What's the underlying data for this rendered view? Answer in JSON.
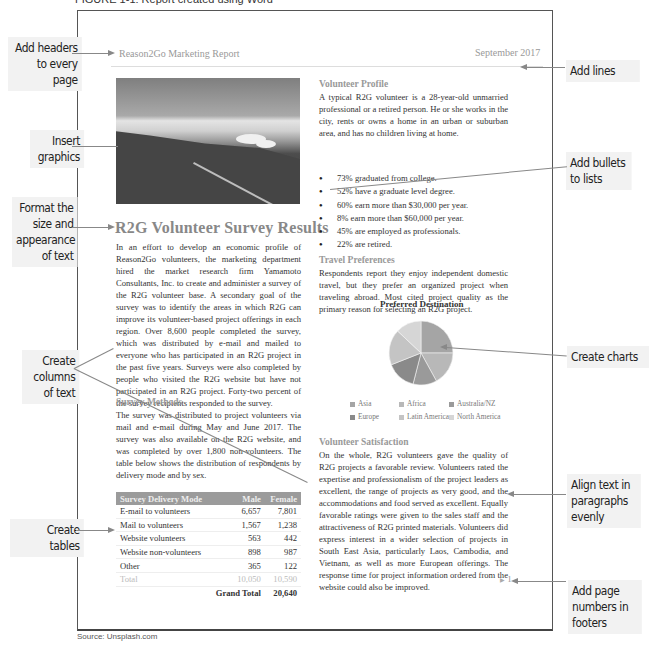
{
  "caption": {
    "top": "FIGURE 1-1: Report created using Word",
    "source": "Source: Unsplash.com"
  },
  "callouts": {
    "headers": "Add headers to every page",
    "graphics": "Insert graphics",
    "format": "Format the size and appearance of text",
    "columns": "Create columns of text",
    "tables": "Create tables",
    "lines": "Add lines",
    "bullets": "Add bullets to lists",
    "charts": "Create charts",
    "align": "Align text in paragraphs evenly",
    "page_numbers": "Add page numbers in footers"
  },
  "document": {
    "header_left": "Reason2Go Marketing Report",
    "header_right": "September 2017",
    "title": "R2G Volunteer Survey Results",
    "intro": "In an effort to develop an economic profile of Reason2Go volunteers, the marketing department hired the market research firm Yamamoto Consultants, Inc. to create and administer a survey of the R2G volunteer base. A secondary goal of the survey was to identify the areas in which R2G can improve its volunteer-based project offerings in each region. Over 8,600 people completed the survey, which was distributed by e-mail and mailed to everyone who has participated in an R2G project in the past five years. Surveys were also completed by people who visited the R2G website but have not participated in an R2G project. Forty-two percent of the survey recipients responded to the survey.",
    "methods_heading": "Survey Methods",
    "methods": "The survey was distributed to project volunteers via mail and e-mail during May and June 2017. The survey was also available on the R2G website, and was completed by over 1,800 non-volunteers. The table below shows the distribution of respondents by delivery mode and by sex.",
    "table": {
      "headers": [
        "Survey Delivery Mode",
        "Male",
        "Female"
      ],
      "rows": [
        [
          "E-mail to volunteers",
          "6,657",
          "7,801"
        ],
        [
          "Mail to volunteers",
          "1,567",
          "1,238"
        ],
        [
          "Website volunteers",
          "563",
          "442"
        ],
        [
          "Website non-volunteers",
          "898",
          "987"
        ],
        [
          "Other",
          "365",
          "122"
        ]
      ],
      "total": [
        "Total",
        "10,050",
        "10,590"
      ],
      "grand_total": [
        "Grand Total",
        "20,640"
      ]
    },
    "profile_heading": "Volunteer Profile",
    "profile": "A typical R2G volunteer is a 28-year-old unmarried professional or a retired person. He or she works in the city, rents or owns a home in an urban or suburban area, and has no children living at home.",
    "bullets": [
      "73% graduated from college.",
      "52% have a graduate level degree.",
      "60% earn more than $30,000 per year.",
      "8% earn more than $60,000 per year.",
      "45% are employed as professionals.",
      "22% are retired."
    ],
    "travel_heading": "Travel Preferences",
    "travel": "Respondents report they enjoy independent domestic travel, but they prefer an organized project when traveling abroad. Most cited project quality as the primary reason for selecting an R2G project.",
    "satisfaction_heading": "Volunteer Satisfaction",
    "satisfaction": "On the whole, R2G volunteers gave the quality of R2G projects a favorable review. Volunteers rated the expertise and professionalism of the project leaders as excellent, the range of projects as very good, and the accommodations and food served as excellent. Equally favorable ratings were given to the sales staff and the attractiveness of R2G printed materials. Volunteers did express interest in a wider selection of projects in South East Asia, particularly Laos, Cambodia, and Vietnam, as well as more European offerings. The response time for project information ordered from the website could also be improved.",
    "page_number": "1"
  },
  "chart_data": {
    "type": "pie",
    "title": "Preferred Destination",
    "categories": [
      "Asia",
      "Africa",
      "Australia/NZ",
      "Europe",
      "Latin America",
      "North America"
    ],
    "values": [
      25,
      17,
      12,
      15,
      18,
      13
    ],
    "colors": [
      "#a5a5a5",
      "#b8b8b8",
      "#9a9a9a",
      "#8a8a8a",
      "#c4c4c4",
      "#d6d6d6"
    ],
    "legend_position": "bottom"
  }
}
